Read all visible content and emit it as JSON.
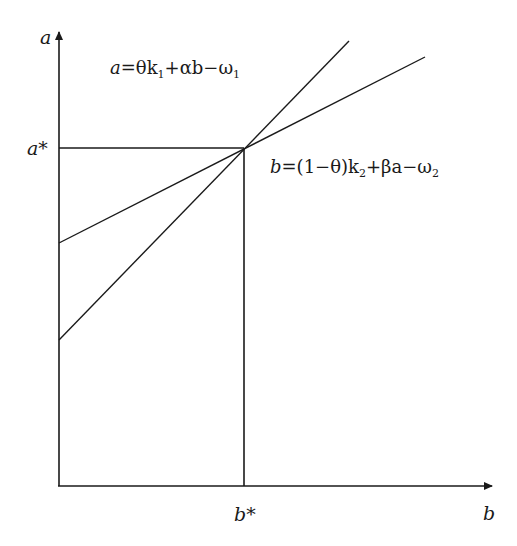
{
  "diagram": {
    "type": "economic equilibrium diagram",
    "axes": {
      "y_label": "a",
      "x_label": "b"
    },
    "equilibrium": {
      "a_star_label": "a*",
      "b_star_label": "b*"
    },
    "lines": [
      {
        "id": "line-a",
        "equation_text": "a=θk₁+αb−ω₁",
        "parts": {
          "lhs": "a",
          "eq": "=θk",
          "sub1": "1",
          "mid": "+αb−ω",
          "sub2": "1"
        },
        "intercept_y": 340,
        "end": [
          349,
          41
        ]
      },
      {
        "id": "line-b",
        "equation_text": "b=(1−θ)k₂+βa−ω₂",
        "parts": {
          "lhs": "b",
          "eq": "=(1−θ)k",
          "sub1": "2",
          "mid": "+βa−ω",
          "sub2": "2"
        },
        "intercept_y": 243,
        "end": [
          425,
          57
        ]
      }
    ],
    "colors": {
      "line": "#1a1a1a",
      "background": "#ffffff"
    }
  }
}
